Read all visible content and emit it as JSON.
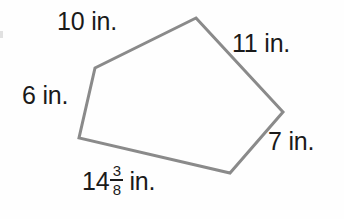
{
  "figure": {
    "type": "irregular-pentagon",
    "unit": "in.",
    "stroke_color": "#8a8a8a",
    "stroke_width": 3,
    "background_color": "#fefefe",
    "text_color": "#1a1a1a",
    "vertices": [
      {
        "name": "top",
        "x": 196,
        "y": 18
      },
      {
        "name": "right",
        "x": 283,
        "y": 112
      },
      {
        "name": "bottom-right",
        "x": 230,
        "y": 173
      },
      {
        "name": "bottom-left",
        "x": 79,
        "y": 138
      },
      {
        "name": "upper-left",
        "x": 95,
        "y": 68
      }
    ],
    "sides": [
      {
        "id": "top",
        "label": "10 in.",
        "value": "10",
        "unit": "in.",
        "from": "upper-left",
        "to": "top"
      },
      {
        "id": "upper-right",
        "label": "11 in.",
        "value": "11",
        "unit": "in.",
        "from": "top",
        "to": "right"
      },
      {
        "id": "lower-right",
        "label": "7 in.",
        "value": "7",
        "unit": "in.",
        "from": "right",
        "to": "bottom-right"
      },
      {
        "id": "bottom",
        "label": "14 3/8 in.",
        "whole": "14",
        "numerator": "3",
        "denominator": "8",
        "unit": "in.",
        "from": "bottom-right",
        "to": "bottom-left"
      },
      {
        "id": "left",
        "label": "6 in.",
        "value": "6",
        "unit": "in.",
        "from": "bottom-left",
        "to": "upper-left"
      }
    ]
  }
}
